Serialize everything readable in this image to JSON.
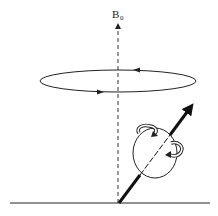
{
  "diagram": {
    "type": "nuclear spin precession",
    "field_label": "B",
    "field_label_subscript": "0",
    "colors": {
      "stroke": "#222222",
      "background": "#ffffff"
    },
    "elements": [
      {
        "name": "field-axis",
        "style": "dashed vertical arrow"
      },
      {
        "name": "precession-orbit",
        "style": "ellipse with directional arrows"
      },
      {
        "name": "magnetic-moment-vector",
        "style": "thick tilted arrow"
      },
      {
        "name": "spinning-nucleus",
        "style": "circle with curved spin arrows"
      },
      {
        "name": "baseline",
        "style": "horizontal line"
      }
    ]
  }
}
